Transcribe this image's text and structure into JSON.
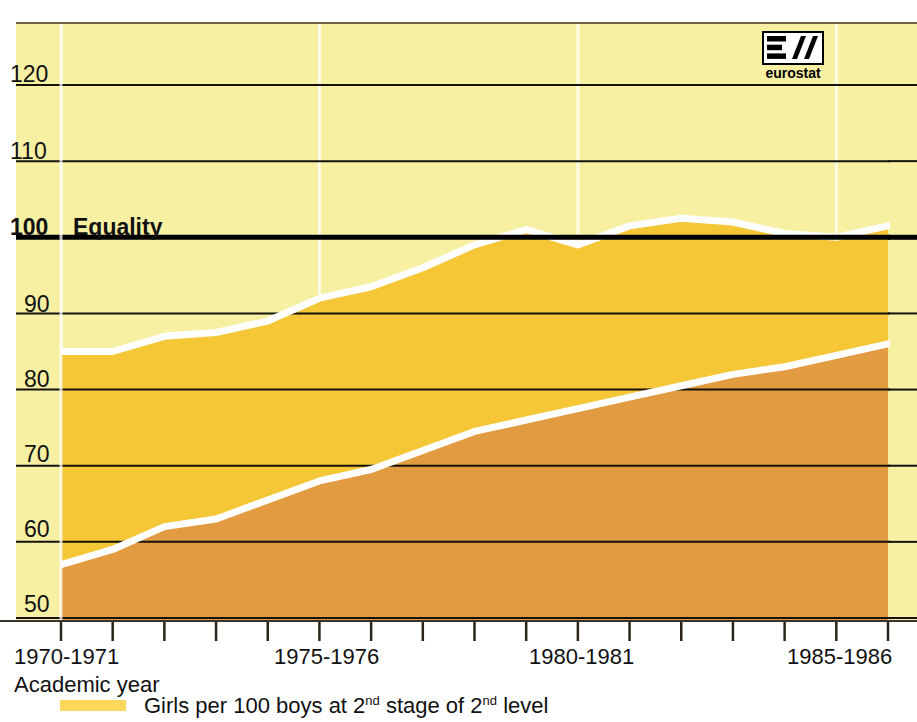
{
  "chart_data": {
    "type": "area",
    "title": "",
    "xlabel": "Academic year",
    "ylabel": "",
    "ylim": [
      45,
      125
    ],
    "yticks": [
      50,
      60,
      70,
      80,
      90,
      100,
      110,
      120
    ],
    "grid": true,
    "reference_line": {
      "value": 100,
      "label": "Equality"
    },
    "legend_position": "bottom-left",
    "categories": [
      "1970-1971",
      "1971-1972",
      "1972-1973",
      "1973-1974",
      "1974-1975",
      "1975-1976",
      "1976-1977",
      "1977-1978",
      "1978-1979",
      "1979-1980",
      "1980-1981",
      "1981-1982",
      "1982-1983",
      "1983-1984",
      "1984-1985",
      "1985-1986",
      "1986-1987"
    ],
    "xticklabels": [
      "1970-1971",
      "1975-1976",
      "1980-1981",
      "1985-1986"
    ],
    "xticklabel_indices": [
      0,
      5,
      10,
      15
    ],
    "series": [
      {
        "name": "Girls per 100 boys at 2nd stage of 2nd level",
        "color": "#F5C636",
        "values": [
          85,
          85,
          87,
          87.5,
          89,
          92,
          93.5,
          96,
          99,
          101,
          99,
          101.5,
          102.5,
          102,
          100.5,
          100,
          101.5
        ]
      },
      {
        "name": "Lower band",
        "color": "#E39B41",
        "values": [
          57,
          59,
          62,
          63,
          65.5,
          68,
          69.5,
          72,
          74.5,
          76,
          77.5,
          79,
          80.5,
          82,
          83,
          84.5,
          86
        ]
      }
    ]
  },
  "logo": {
    "name": "eurostat",
    "wordmark": "eurostat"
  },
  "colors": {
    "background": "#F7F0A3",
    "band_upper": "#F5C636",
    "band_lower": "#E39B41",
    "legend_swatch": "#FAD85C",
    "gridline": "#1a1a1a",
    "equality_line": "#000000"
  }
}
